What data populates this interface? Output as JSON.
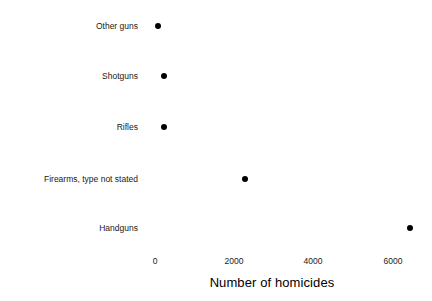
{
  "chart_data": {
    "type": "scatter",
    "title": "",
    "xlabel": "Number of homicides",
    "ylabel": "Firearm type",
    "categories": [
      "Other guns",
      "Shotguns",
      "Rifles",
      "Firearms, type not stated",
      "Handguns"
    ],
    "values": [
      100,
      230,
      235,
      2270,
      6420
    ],
    "xlim": [
      -230,
      6700
    ],
    "xticks": [
      0,
      2000,
      4000,
      6000
    ],
    "xtick_labels": [
      "0",
      "2000",
      "4000",
      "6000"
    ],
    "grid": false,
    "legend": false,
    "point_color": "#000000",
    "background_color": "#ffffff",
    "points": [
      {
        "category": "Other guns",
        "value": 100,
        "px": 158,
        "py": 26
      },
      {
        "category": "Shotguns",
        "value": 230,
        "px": 164,
        "py": 76
      },
      {
        "category": "Rifles",
        "value": 235,
        "px": 164,
        "py": 127
      },
      {
        "category": "Firearms, type not stated",
        "value": 2270,
        "px": 245,
        "py": 179
      },
      {
        "category": "Handguns",
        "value": 6420,
        "px": 410,
        "py": 228
      }
    ],
    "xtick_positions_px": [
      155,
      234,
      313,
      393
    ]
  }
}
